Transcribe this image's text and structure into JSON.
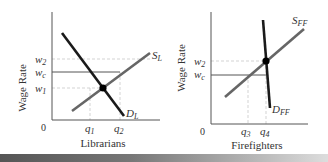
{
  "colors": {
    "axis": "#555555",
    "curve": "#222222",
    "supply": "#666666",
    "guide": "#cccccc",
    "wage_line": "#555555",
    "point": "#000000"
  },
  "left_chart": {
    "y_axis_label": "Wage Rate",
    "x_axis_label": "Librarians",
    "origin_label": "0",
    "y_ticks": [
      {
        "base": "w",
        "sub": "2"
      },
      {
        "base": "w",
        "sub": "c"
      },
      {
        "base": "w",
        "sub": "1"
      }
    ],
    "x_ticks": [
      {
        "base": "q",
        "sub": "1"
      },
      {
        "base": "q",
        "sub": "2"
      }
    ],
    "supply_label": {
      "base": "S",
      "sub": "L"
    },
    "demand_label": {
      "base": "D",
      "sub": "L"
    }
  },
  "right_chart": {
    "y_axis_label": "Wage Rate",
    "x_axis_label": "Firefighters",
    "origin_label": "0",
    "y_ticks": [
      {
        "base": "w",
        "sub": "2"
      },
      {
        "base": "w",
        "sub": "c"
      }
    ],
    "x_ticks": [
      {
        "base": "q",
        "sub": "3"
      },
      {
        "base": "q",
        "sub": "4"
      }
    ],
    "supply_label": {
      "base": "S",
      "sub": "FF"
    },
    "demand_label": {
      "base": "D",
      "sub": "FF"
    }
  }
}
